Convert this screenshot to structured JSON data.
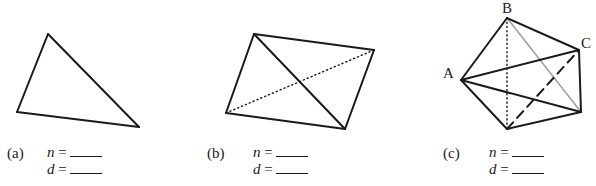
{
  "figures": [
    {
      "id": "a",
      "caption": "(a)",
      "shape": "triangle",
      "vertices": [
        [
          48,
          34
        ],
        [
          17,
          112
        ],
        [
          139,
          127
        ]
      ],
      "solid_edges": [
        [
          0,
          1
        ],
        [
          1,
          2
        ],
        [
          2,
          0
        ]
      ],
      "dotted_edges": [],
      "dashed_edges": [],
      "grey_edges": [],
      "answers": [
        {
          "var": "n",
          "eq": " =",
          "value": ""
        },
        {
          "var": "d",
          "eq": " =",
          "value": ""
        }
      ]
    },
    {
      "id": "b",
      "caption": "(b)",
      "shape": "quadrilateral",
      "vertices": [
        [
          254,
          34
        ],
        [
          374,
          50
        ],
        [
          345,
          129
        ],
        [
          226,
          113
        ]
      ],
      "solid_edges": [
        [
          0,
          1
        ],
        [
          1,
          2
        ],
        [
          2,
          3
        ],
        [
          3,
          0
        ],
        [
          0,
          2
        ]
      ],
      "dotted_edges": [
        [
          3,
          1
        ]
      ],
      "dashed_edges": [],
      "grey_edges": [],
      "answers": [
        {
          "var": "n",
          "eq": " =",
          "value": ""
        },
        {
          "var": "d",
          "eq": " =",
          "value": ""
        }
      ]
    },
    {
      "id": "c",
      "caption": "(c)",
      "shape": "pentagon",
      "vertex_labels": {
        "A": "A",
        "B": "B",
        "C": "C"
      },
      "vertices": [
        [
          507,
          18
        ],
        [
          579,
          50
        ],
        [
          581,
          112
        ],
        [
          507,
          129
        ],
        [
          461,
          80
        ]
      ],
      "solid_edges": [
        [
          0,
          1
        ],
        [
          1,
          2
        ],
        [
          2,
          3
        ],
        [
          3,
          4
        ],
        [
          4,
          0
        ],
        [
          4,
          1
        ],
        [
          4,
          2
        ]
      ],
      "dotted_edges": [
        [
          0,
          3
        ]
      ],
      "dashed_edges": [
        [
          3,
          1
        ]
      ],
      "grey_edges": [
        [
          0,
          2
        ]
      ],
      "answers": [
        {
          "var": "n",
          "eq": " =",
          "value": ""
        },
        {
          "var": "d",
          "eq": " =",
          "value": ""
        }
      ]
    }
  ],
  "colors": {
    "line": "#1a1a1a",
    "grey_line": "#a0a0a0",
    "background": "#ffffff"
  }
}
